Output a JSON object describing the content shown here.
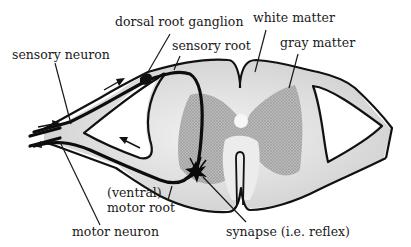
{
  "labels": {
    "dorsal_root_ganglion": "dorsal root ganglion",
    "sensory_root": "sensory root",
    "white_matter": "white matter",
    "gray_matter": "gray matter",
    "sensory_neuron": "sensory neuron",
    "ventral_line1": "(ventral)",
    "ventral_line2": "motor root",
    "motor_neuron": "motor neuron",
    "synapse": "synapse (i.e. reflex)"
  },
  "colors": {
    "white_matter_fill": "#d4d4d4",
    "gray_matter_fill": "#a8a8a8",
    "root_fill": "#c4c4c4",
    "outline": "#111111",
    "background": "#ffffff"
  }
}
